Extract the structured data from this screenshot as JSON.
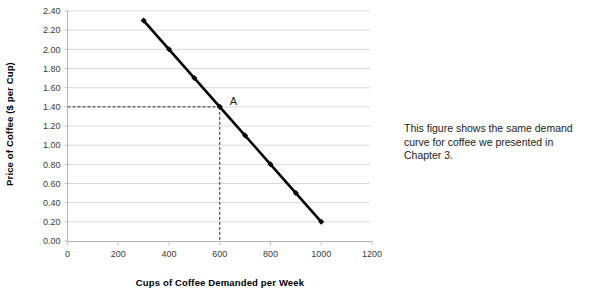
{
  "caption": {
    "text": "This figure shows the same demand curve for coffee we presented in Chapter 3."
  },
  "chart_data": {
    "type": "line",
    "title": "",
    "xlabel": "Cups of Coffee Demanded per Week",
    "ylabel": "Price of Coffee ($ per Cup)",
    "x": [
      300,
      400,
      500,
      600,
      700,
      800,
      900,
      1000
    ],
    "values": [
      2.3,
      2.0,
      1.7,
      1.4,
      1.1,
      0.8,
      0.5,
      0.2
    ],
    "series": [
      {
        "name": "Demand",
        "values": [
          2.3,
          2.0,
          1.7,
          1.4,
          1.1,
          0.8,
          0.5,
          0.2
        ]
      }
    ],
    "xlim": [
      0,
      1200
    ],
    "ylim": [
      0.0,
      2.4
    ],
    "xticks": [
      0,
      200,
      400,
      600,
      800,
      1000,
      1200
    ],
    "xtick_labels": [
      "0",
      "200",
      "400",
      "600",
      "800",
      "1000",
      "1200"
    ],
    "yticks": [
      0.0,
      0.2,
      0.4,
      0.6,
      0.8,
      1.0,
      1.2,
      1.4,
      1.6,
      1.8,
      2.0,
      2.2,
      2.4
    ],
    "ytick_labels": [
      "0.00",
      "0.20",
      "0.40",
      "0.60",
      "0.80",
      "1.00",
      "1.20",
      "1.40",
      "1.60",
      "1.80",
      "2.00",
      "2.20",
      "2.40"
    ],
    "grid": "horizontal",
    "legend": "none",
    "line_color": "#000000",
    "grid_color": "#d9d9d9",
    "axis_color": "#bfbfbf",
    "annotations": [
      {
        "label": "A",
        "x": 600,
        "y": 1.4,
        "guides": "dashed lines from axes to point A at quantity 600, price 1.40"
      }
    ]
  }
}
